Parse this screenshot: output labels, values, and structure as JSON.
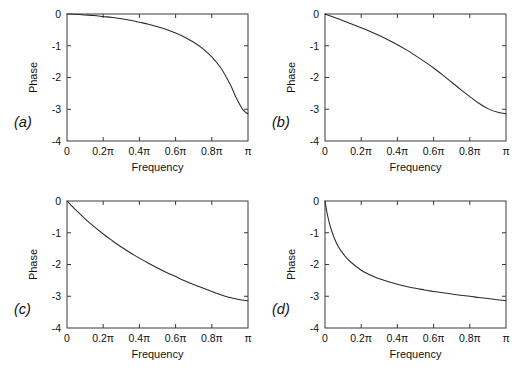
{
  "figure": {
    "title": "",
    "background": "#ffffff",
    "line_color": "#2a2a2a",
    "axis_color": "#3a3a3a",
    "panel_count": 4
  },
  "panels": [
    {
      "id": "a",
      "letter": "(a)",
      "xlabel": "Frequency",
      "ylabel": "Phase",
      "xticklabels": [
        "0",
        "0.2π",
        "0.4π",
        "0.6π",
        "0.8π",
        "π"
      ],
      "yticklabels": [
        "0",
        "-1",
        "-2",
        "-3",
        "-4"
      ]
    },
    {
      "id": "b",
      "letter": "(b)",
      "xlabel": "Frequency",
      "ylabel": "Phase",
      "xticklabels": [
        "0",
        "0.2π",
        "0.4π",
        "0.6π",
        "0.8π",
        "π"
      ],
      "yticklabels": [
        "0",
        "-1",
        "-2",
        "-3",
        "-4"
      ]
    },
    {
      "id": "c",
      "letter": "(c)",
      "xlabel": "Frequency",
      "ylabel": "Phase",
      "xticklabels": [
        "0",
        "0.2π",
        "0.4π",
        "0.6π",
        "0.8π",
        "π"
      ],
      "yticklabels": [
        "0",
        "-1",
        "-2",
        "-3",
        "-4"
      ]
    },
    {
      "id": "d",
      "letter": "(d)",
      "xlabel": "Frequency",
      "ylabel": "Phase",
      "xticklabels": [
        "0",
        "0.2π",
        "0.4π",
        "0.6π",
        "0.8π",
        "π"
      ],
      "yticklabels": [
        "0",
        "-1",
        "-2",
        "-3",
        "-4"
      ]
    }
  ],
  "chart_data": [
    {
      "type": "line",
      "panel": "a",
      "title": "",
      "xlabel": "Frequency",
      "ylabel": "Phase",
      "xlim": [
        0,
        1
      ],
      "ylim": [
        -4,
        0
      ],
      "xticks": [
        0,
        0.2,
        0.4,
        0.6,
        0.8,
        1
      ],
      "xticklabels": [
        "0",
        "0.2π",
        "0.4π",
        "0.6π",
        "0.8π",
        "π"
      ],
      "yticks": [
        0,
        -1,
        -2,
        -3,
        -4
      ],
      "yticklabels": [
        "0",
        "-1",
        "-2",
        "-3",
        "-4"
      ],
      "grid": false,
      "legend": false,
      "x": [
        0,
        0.05,
        0.1,
        0.15,
        0.2,
        0.25,
        0.3,
        0.35,
        0.4,
        0.45,
        0.5,
        0.55,
        0.6,
        0.65,
        0.7,
        0.75,
        0.8,
        0.85,
        0.9,
        0.93,
        0.95,
        0.97,
        0.98,
        0.99,
        1.0
      ],
      "y": [
        0,
        -0.01,
        -0.03,
        -0.05,
        -0.08,
        -0.11,
        -0.15,
        -0.2,
        -0.26,
        -0.32,
        -0.4,
        -0.49,
        -0.6,
        -0.73,
        -0.89,
        -1.09,
        -1.35,
        -1.7,
        -2.2,
        -2.58,
        -2.8,
        -3.0,
        -3.06,
        -3.11,
        -3.14
      ]
    },
    {
      "type": "line",
      "panel": "b",
      "title": "",
      "xlabel": "Frequency",
      "ylabel": "Phase",
      "xlim": [
        0,
        1
      ],
      "ylim": [
        -4,
        0
      ],
      "xticks": [
        0,
        0.2,
        0.4,
        0.6,
        0.8,
        1
      ],
      "xticklabels": [
        "0",
        "0.2π",
        "0.4π",
        "0.6π",
        "0.8π",
        "π"
      ],
      "yticks": [
        0,
        -1,
        -2,
        -3,
        -4
      ],
      "yticklabels": [
        "0",
        "-1",
        "-2",
        "-3",
        "-4"
      ],
      "grid": false,
      "legend": false,
      "x": [
        0,
        0.05,
        0.1,
        0.15,
        0.2,
        0.25,
        0.3,
        0.35,
        0.4,
        0.45,
        0.5,
        0.55,
        0.6,
        0.65,
        0.7,
        0.75,
        0.8,
        0.85,
        0.9,
        0.95,
        1.0
      ],
      "y": [
        0,
        -0.1,
        -0.21,
        -0.32,
        -0.43,
        -0.55,
        -0.68,
        -0.82,
        -0.97,
        -1.13,
        -1.31,
        -1.5,
        -1.7,
        -1.92,
        -2.15,
        -2.38,
        -2.6,
        -2.81,
        -2.98,
        -3.09,
        -3.14
      ]
    },
    {
      "type": "line",
      "panel": "c",
      "title": "",
      "xlabel": "Frequency",
      "ylabel": "Phase",
      "xlim": [
        0,
        1
      ],
      "ylim": [
        -4,
        0
      ],
      "xticks": [
        0,
        0.2,
        0.4,
        0.6,
        0.8,
        1
      ],
      "xticklabels": [
        "0",
        "0.2π",
        "0.4π",
        "0.6π",
        "0.8π",
        "π"
      ],
      "yticks": [
        0,
        -1,
        -2,
        -3,
        -4
      ],
      "yticklabels": [
        "0",
        "-1",
        "-2",
        "-3",
        "-4"
      ],
      "grid": false,
      "legend": false,
      "x": [
        0,
        0.05,
        0.1,
        0.15,
        0.2,
        0.25,
        0.3,
        0.35,
        0.4,
        0.45,
        0.5,
        0.55,
        0.6,
        0.65,
        0.7,
        0.75,
        0.8,
        0.85,
        0.9,
        0.95,
        1.0
      ],
      "y": [
        0,
        -0.29,
        -0.56,
        -0.81,
        -1.04,
        -1.25,
        -1.45,
        -1.63,
        -1.8,
        -1.96,
        -2.11,
        -2.25,
        -2.38,
        -2.51,
        -2.63,
        -2.74,
        -2.85,
        -2.95,
        -3.04,
        -3.1,
        -3.14
      ]
    },
    {
      "type": "line",
      "panel": "d",
      "title": "",
      "xlabel": "Frequency",
      "ylabel": "Phase",
      "xlim": [
        0,
        1
      ],
      "ylim": [
        -4,
        0
      ],
      "xticks": [
        0,
        0.2,
        0.4,
        0.6,
        0.8,
        1
      ],
      "xticklabels": [
        "0",
        "0.2π",
        "0.4π",
        "0.6π",
        "0.8π",
        "π"
      ],
      "yticks": [
        0,
        -1,
        -2,
        -3,
        -4
      ],
      "yticklabels": [
        "0",
        "-1",
        "-2",
        "-3",
        "-4"
      ],
      "grid": false,
      "legend": false,
      "x": [
        0,
        0.01,
        0.02,
        0.03,
        0.05,
        0.07,
        0.09,
        0.12,
        0.15,
        0.2,
        0.25,
        0.3,
        0.35,
        0.4,
        0.45,
        0.5,
        0.55,
        0.6,
        0.65,
        0.7,
        0.75,
        0.8,
        0.85,
        0.9,
        0.95,
        1.0
      ],
      "y": [
        0,
        -0.33,
        -0.6,
        -0.82,
        -1.15,
        -1.4,
        -1.58,
        -1.8,
        -1.96,
        -2.18,
        -2.33,
        -2.45,
        -2.54,
        -2.62,
        -2.69,
        -2.75,
        -2.8,
        -2.85,
        -2.89,
        -2.93,
        -2.97,
        -3.0,
        -3.04,
        -3.07,
        -3.11,
        -3.14
      ]
    }
  ]
}
